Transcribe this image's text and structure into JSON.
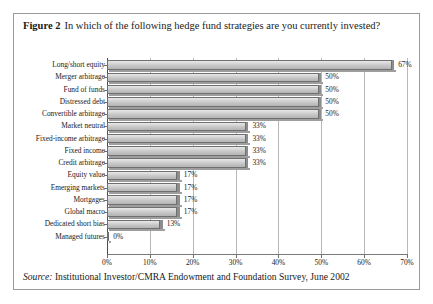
{
  "figure": {
    "number_label": "Figure 2",
    "caption": "In which of the following hedge fund strategies are you currently invested?",
    "source_lead": "Source:",
    "source_text": "Institutional Investor/CMRA Endowment and Foundation Survey, June 2002"
  },
  "chart_data": {
    "type": "bar",
    "orientation": "horizontal",
    "title": "In which of the following hedge fund strategies are you currently invested?",
    "xlabel": "",
    "ylabel": "",
    "xlim": [
      0,
      70
    ],
    "grid": true,
    "legend": "none",
    "tick_labels": [
      "0%",
      "10%",
      "20%",
      "30%",
      "40%",
      "50%",
      "60%",
      "70%"
    ],
    "ticks": [
      0,
      10,
      20,
      30,
      40,
      50,
      60,
      70
    ],
    "categories": [
      "Long/short equity",
      "Merger arbitrage",
      "Fund of funds",
      "Distressed debt",
      "Convertible arbitrage",
      "Market neutral",
      "Fixed-income arbitrage",
      "Fixed income",
      "Credit arbitrage",
      "Equity value",
      "Emerging markets",
      "Mortgages",
      "Global macro",
      "Dedicated short bias",
      "Managed futures"
    ],
    "values": [
      67,
      50,
      50,
      50,
      50,
      33,
      33,
      33,
      33,
      17,
      17,
      17,
      17,
      13,
      0
    ],
    "data_labels": [
      "67%",
      "50%",
      "50%",
      "50%",
      "50%",
      "33%",
      "33%",
      "33%",
      "33%",
      "17%",
      "17%",
      "17%",
      "17%",
      "13%",
      "0%"
    ],
    "colors": {
      "bar_fill": "#d2d2d2",
      "bar_edge": "#6f6f6f",
      "bar_cap": "#8d8d8d",
      "gridline": "#b8b8b8",
      "axis": "#4d4d4d",
      "text": "#1a1a1a",
      "frame": "#9a9a9a"
    }
  }
}
